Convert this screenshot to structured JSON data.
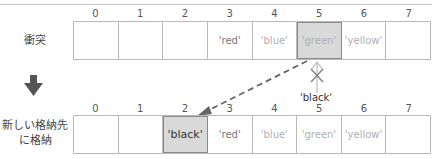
{
  "header": {
    "caption": ""
  },
  "collision_row": {
    "label": "衝突",
    "indices": [
      "0",
      "1",
      "2",
      "3",
      "4",
      "5",
      "6",
      "7"
    ],
    "cells": [
      "",
      "",
      "",
      "'red'",
      "'blue'",
      "'green'",
      "'yellow'",
      ""
    ],
    "highlighted_index": 5
  },
  "transition": {
    "arrow": "down-arrow-icon",
    "blocked_value": "'black'",
    "blocked_marker": "x-mark-icon"
  },
  "stored_row": {
    "label_line1": "新しい格納先",
    "label_line2": "に格納",
    "indices": [
      "0",
      "1",
      "2",
      "3",
      "4",
      "5",
      "6",
      "7"
    ],
    "cells": [
      "",
      "",
      "'black'",
      "'red'",
      "'blue'",
      "'green'",
      "'yellow'",
      ""
    ],
    "highlighted_index": 2
  },
  "colors": {
    "highlight_fill": "#d9d9d9",
    "border": "#b9b9b9",
    "arrow": "#555555"
  }
}
